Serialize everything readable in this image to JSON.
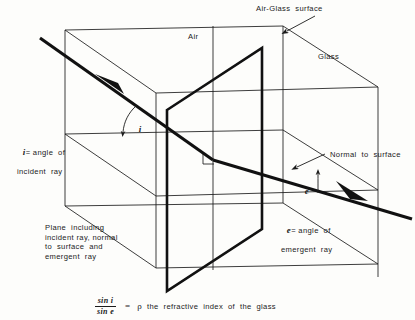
{
  "figure": {
    "colors": {
      "ray": "#111111",
      "plane_line": "#1b1b1b",
      "text": "#1b1b1b",
      "background": "#fdfdfb"
    },
    "labels": {
      "air": "Air",
      "glass": "Glass",
      "air_glass_surface": "Air-Glass  surface",
      "normal_to_surface": "Normal  to  surface",
      "angle_i_symbol": "i",
      "angle_e_symbol": "e",
      "incident_line1": "= angle  of",
      "incident_line2": "incident  ray",
      "emergent_line1": "= angle  of",
      "emergent_line2": "emergent  ray",
      "plane_line1": "Plane  including",
      "plane_line2": "incident ray, normal",
      "plane_line3": "to  surface  and",
      "plane_line4": "emergent  ray"
    },
    "formula": {
      "numerator": "sin i",
      "denominator": "sin e",
      "equals": "=",
      "refractive_symbol": "ρ",
      "description": "the  refractive  index  of  the  glass"
    },
    "icons": {
      "arrow_incident": "arrow-right-down-icon",
      "arrow_emergent": "arrow-right-down-icon",
      "arrow_callout_surface": "arrow-pointer-icon",
      "arrow_callout_normal": "arrow-pointer-icon",
      "right_angle": "right-angle-marker-icon",
      "arc_i": "angle-arc-icon",
      "arc_e": "angle-arc-icon"
    }
  }
}
